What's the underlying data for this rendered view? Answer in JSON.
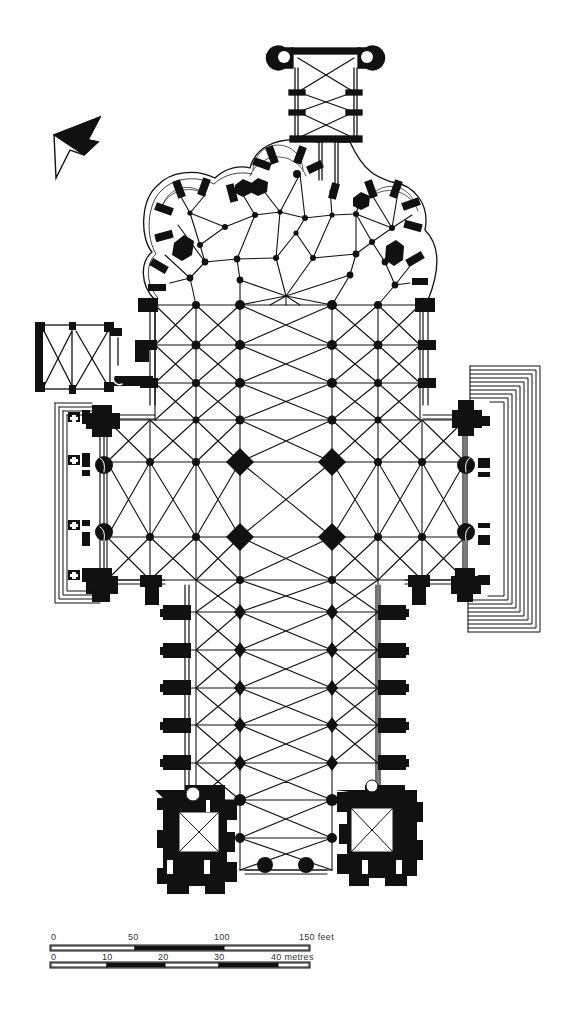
{
  "figure": {
    "type": "architectural floor plan",
    "colors": {
      "ink": "#111111",
      "paper": "#ffffff",
      "scale_text": "#333333"
    }
  },
  "north_arrow": {
    "icon": "north-arrow-icon"
  },
  "scale_bars": {
    "feet": {
      "unit_label": "150 feet",
      "ticks": [
        "0",
        "50",
        "100",
        "150 feet"
      ],
      "tick_values": [
        0,
        50,
        100,
        150
      ],
      "segments": [
        "white",
        "black",
        "white"
      ]
    },
    "metres": {
      "unit_label": "40 metres",
      "ticks": [
        "0",
        "10",
        "20",
        "30",
        "40 metres"
      ],
      "tick_values": [
        0,
        10,
        20,
        30,
        40
      ],
      "segments": [
        "white",
        "black",
        "white",
        "black",
        "white"
      ]
    }
  },
  "plan_parts": [
    "axial-chapel",
    "chevet-radiating-chapels",
    "ambulatory",
    "choir",
    "crossing",
    "north-transept",
    "south-transept",
    "transept-porches",
    "sacristy",
    "nave",
    "aisles",
    "nave-buttresses",
    "west-towers",
    "west-facade"
  ]
}
